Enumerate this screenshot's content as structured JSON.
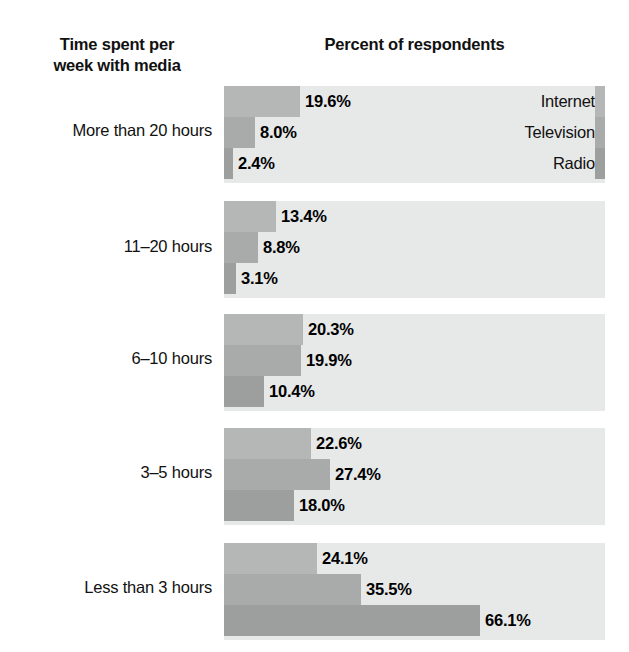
{
  "headers": {
    "left": "Time spent per\nweek with media",
    "left_line1": "Time spent per",
    "left_line2": "week with media",
    "right": "Percent of respondents"
  },
  "legend": {
    "items": [
      {
        "label": "Internet",
        "color": "#b5b6b6"
      },
      {
        "label": "Television",
        "color": "#a9abab"
      },
      {
        "label": "Radio",
        "color": "#9d9f9f"
      }
    ]
  },
  "colors": {
    "panel_background": "#e7e8e8",
    "page_background": "#ffffff",
    "text": "#111111",
    "internet": "#b5b6b6",
    "television": "#a9abab",
    "radio": "#9d9f9f"
  },
  "chart_data": {
    "type": "bar",
    "orientation": "horizontal",
    "title": "Percent of respondents",
    "xlabel": "Percent of respondents",
    "ylabel": "Time spent per week with media",
    "grid": false,
    "legend_position": "inside-right-first-group",
    "xlim": [
      0,
      100
    ],
    "value_suffix": "%",
    "categories": [
      "More than 20 hours",
      "11–20 hours",
      "6–10 hours",
      "3–5 hours",
      "Less than 3 hours"
    ],
    "series": [
      {
        "name": "Internet",
        "values": [
          19.6,
          13.4,
          20.3,
          22.6,
          24.1
        ]
      },
      {
        "name": "Television",
        "values": [
          8.0,
          8.8,
          19.9,
          27.4,
          35.5
        ]
      },
      {
        "name": "Radio",
        "values": [
          2.4,
          3.1,
          10.4,
          18.0,
          66.1
        ]
      }
    ],
    "labels": [
      [
        "19.6%",
        "8.0%",
        "2.4%"
      ],
      [
        "13.4%",
        "8.8%",
        "3.1%"
      ],
      [
        "20.3%",
        "19.9%",
        "10.4%"
      ],
      [
        "22.6%",
        "27.4%",
        "18.0%"
      ],
      [
        "24.1%",
        "35.5%",
        "66.1%"
      ]
    ]
  },
  "layout": {
    "group_tops": [
      86,
      201,
      314,
      428,
      543
    ],
    "group_height": 97,
    "label_tops": [
      120,
      236,
      348,
      462,
      577
    ],
    "panel_left": 224,
    "panel_width": 381,
    "px_per_percent": 3.87
  }
}
